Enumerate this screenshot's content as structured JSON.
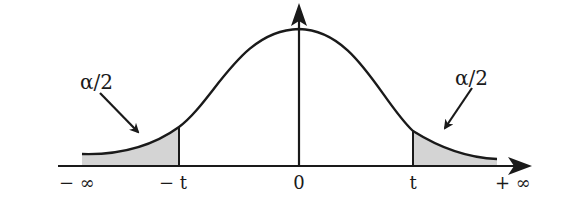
{
  "diagram": {
    "type": "t-distribution two-tailed critical regions",
    "colors": {
      "stroke": "#1a1a1a",
      "tail_fill": "#d4d4d4",
      "background": "#ffffff"
    },
    "axis_labels": {
      "neg_inf": "− ∞",
      "neg_t": "− t",
      "zero": "0",
      "pos_t": "t",
      "pos_inf": "+ ∞"
    },
    "annotations": {
      "left_tail": "α/2",
      "right_tail": "α/2"
    }
  }
}
